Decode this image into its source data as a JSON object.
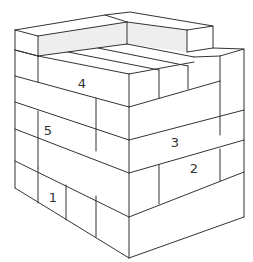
{
  "figure": {
    "line_color": "#333333",
    "shade_color": "#eeeeee",
    "background": "#ffffff"
  },
  "labels": [
    {
      "id": "1",
      "text": "1",
      "x": 53,
      "y": 197
    },
    {
      "id": "2",
      "text": "2",
      "x": 194,
      "y": 168
    },
    {
      "id": "3",
      "text": "3",
      "x": 175,
      "y": 142
    },
    {
      "id": "4",
      "text": "4",
      "x": 82,
      "y": 83
    },
    {
      "id": "5",
      "text": "5",
      "x": 48,
      "y": 130
    }
  ]
}
